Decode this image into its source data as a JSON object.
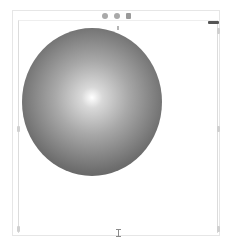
{
  "toolbar": {
    "icons": [
      "circle-icon",
      "circle-icon",
      "square-icon"
    ]
  },
  "canvas": {
    "shape": "sphere",
    "gradient": {
      "type": "radial",
      "center_color": "#ffffff",
      "edge_color": "#4a4a4a"
    },
    "frame_color": "#dcdcdc",
    "handle_color": "#d0d0d0",
    "grip_color": "#555555"
  }
}
